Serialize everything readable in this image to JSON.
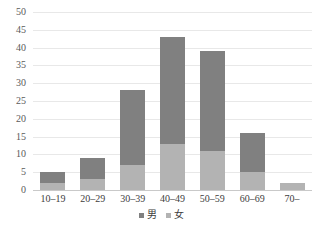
{
  "chart_data": {
    "type": "bar",
    "subtype": "stacked-bar",
    "title": "",
    "xlabel": "",
    "ylabel": "",
    "categories": [
      "10–19",
      "20–29",
      "30–39",
      "40–49",
      "50–59",
      "60–69",
      "70–"
    ],
    "series": [
      {
        "name": "男",
        "values": [
          3,
          6,
          21,
          30,
          28,
          11,
          0
        ],
        "color": "#808080"
      },
      {
        "name": "女",
        "values": [
          2,
          3,
          7,
          13,
          11,
          5,
          2
        ],
        "color": "#b3b3b3"
      }
    ],
    "totals": [
      5,
      9,
      28,
      43,
      39,
      16,
      2
    ],
    "ylim": [
      0,
      50
    ],
    "ytick_step": 5,
    "yticks": [
      "50",
      "45",
      "40",
      "35",
      "30",
      "25",
      "20",
      "15",
      "10",
      "5",
      "0"
    ],
    "ytick_values": [
      50,
      45,
      40,
      35,
      30,
      25,
      20,
      15,
      10,
      5,
      0
    ],
    "grid": true,
    "grid_axis": "y",
    "legend_position": "bottom",
    "stack_order": "female-bottom-male-top"
  },
  "colors": {
    "male": "#808080",
    "female": "#b3b3b3",
    "gridline": "#e8e8e8",
    "axis": "#c9c9c9",
    "tick_text": "#5a5a5a",
    "label_text": "#3d3d3d",
    "background": "#ffffff"
  },
  "legend": {
    "items": [
      {
        "label": "男",
        "swatch": "male"
      },
      {
        "label": "女",
        "swatch": "female"
      }
    ]
  }
}
